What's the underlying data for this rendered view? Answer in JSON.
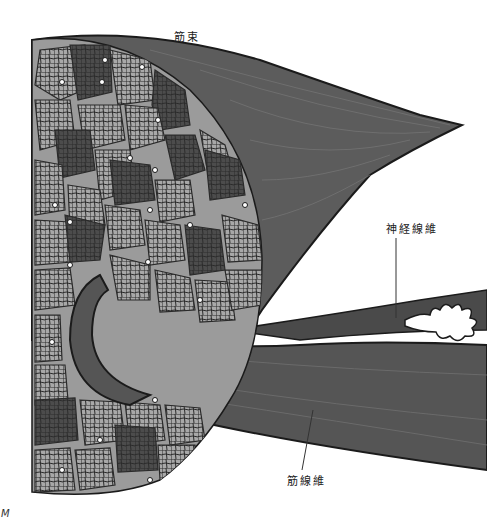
{
  "figure": {
    "type": "anatomical-illustration",
    "labels": {
      "fascicle": "筋束",
      "nerve_fiber": "神経線維",
      "muscle_fiber": "筋線維"
    },
    "corner_mark": "M",
    "colors": {
      "background": "#ffffff",
      "fascicle_fill": "#5a5a5a",
      "cross_section_bg": "#9a9a9a",
      "fiber_light": "#8c8c8c",
      "fiber_dark": "#4a4a4a",
      "outline": "#1e1e1e",
      "nerve_ending": "#ffffff"
    }
  }
}
